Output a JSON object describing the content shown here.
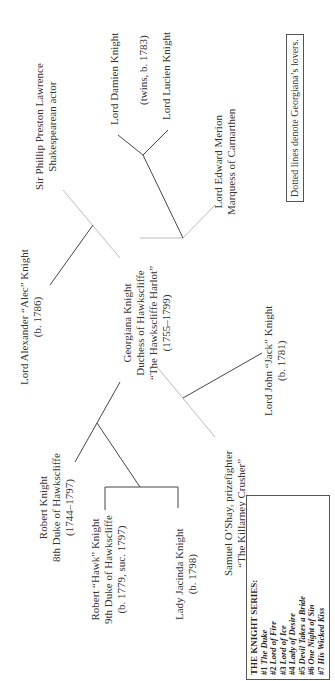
{
  "diagram": {
    "orientation": "rotated-90-ccw",
    "people": [
      {
        "id": "phillip",
        "lines": [
          "Sir Phillip Preston Lawrence",
          "Shakespearean actor"
        ]
      },
      {
        "id": "alexander",
        "lines": [
          "Lord Alexander “Alec” Knight",
          "(b. 1786)"
        ]
      },
      {
        "id": "robert8",
        "lines": [
          "Robert Knight",
          "8th Duke of Hawkscliffe",
          "(1744–1797)"
        ]
      },
      {
        "id": "hawk",
        "lines": [
          "Robert “Hawk” Knight",
          "9th Duke of Hawkscliffe",
          "(b. 1779, suc. 1797)"
        ]
      },
      {
        "id": "georgiana",
        "lines": [
          "Georgiana Knight",
          "Duchess of Hawkscliffe",
          "“The Hawkscliffe Harlot”",
          "(1755–1799)"
        ]
      },
      {
        "id": "jacinda",
        "lines": [
          "Lady Jacinda Knight",
          "(b. 1798)"
        ]
      },
      {
        "id": "samuel",
        "lines": [
          "Samuel O’Shay, prizefighter",
          "“The Killarney Crusher”"
        ]
      },
      {
        "id": "damien",
        "lines": [
          "Lord Damien Knight"
        ]
      },
      {
        "id": "twins",
        "lines": [
          "(twins, b. 1783)"
        ]
      },
      {
        "id": "lucien",
        "lines": [
          "Lord Lucien Knight"
        ]
      },
      {
        "id": "edward",
        "lines": [
          "Lord Edward Merion",
          "Marquess of Carnarthen"
        ]
      },
      {
        "id": "jack",
        "lines": [
          "Lord John “Jack” Knight",
          "(b. 1781)"
        ]
      }
    ],
    "legend_note": "Dotted lines denote Georgiana’s lovers.",
    "series": {
      "title": "THE KNIGHT SERIES:",
      "books": [
        {
          "num": "#1",
          "title": "The Duke"
        },
        {
          "num": "#2",
          "title": "Lord of Fire"
        },
        {
          "num": "#3",
          "title": "Lord of Ice"
        },
        {
          "num": "#4",
          "title": "Lady of Desire"
        },
        {
          "num": "#5",
          "title": "Devil Takes a Bride"
        },
        {
          "num": "#6",
          "title": "One Night of Sin"
        },
        {
          "num": "#7",
          "title": "His Wicked Kiss"
        }
      ]
    },
    "colors": {
      "solid_line": "#444444",
      "lover_line": "#b8b8b8",
      "text": "#333333"
    }
  }
}
